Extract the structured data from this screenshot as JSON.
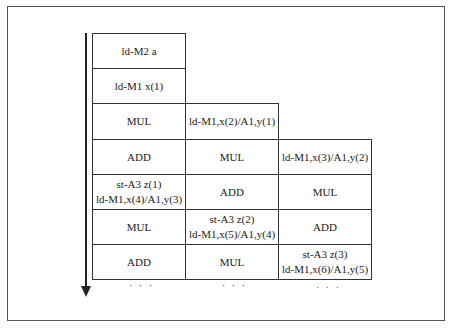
{
  "diagram": {
    "type": "pipeline-schedule",
    "time_arrow": "down",
    "columns": 3,
    "rows": [
      [
        "ld-M2 a",
        null,
        null
      ],
      [
        "ld-M1 x(1)",
        null,
        null
      ],
      [
        "MUL",
        "ld-M1,x(2)/A1,y(1)",
        null
      ],
      [
        "ADD",
        "MUL",
        "ld-M1,x(3)/A1,y(2)"
      ],
      [
        [
          "st-A3 z(1)",
          "ld-M1,x(4)/A1,y(3)"
        ],
        "ADD",
        "MUL"
      ],
      [
        "MUL",
        [
          "st-A3 z(2)",
          "ld-M1,x(5)/A1,y(4)"
        ],
        "ADD"
      ],
      [
        "ADD",
        "MUL",
        [
          "st-A3 z(3)",
          "ld-M1,x(6)/A1,y(5)"
        ]
      ]
    ],
    "continuation": [
      "· · ·",
      "· · ·",
      "· · ·"
    ]
  },
  "cells": {
    "r0c0": "ld-M2 a",
    "r1c0": "ld-M1 x(1)",
    "r2c0": "MUL",
    "r2c1": "ld-M1,x(2)/A1,y(1)",
    "r3c0": "ADD",
    "r3c1": "MUL",
    "r3c2": "ld-M1,x(3)/A1,y(2)",
    "r4c0a": "st-A3 z(1)",
    "r4c0b": "ld-M1,x(4)/A1,y(3)",
    "r4c1": "ADD",
    "r4c2": "MUL",
    "r5c0": "MUL",
    "r5c1a": "st-A3 z(2)",
    "r5c1b": "ld-M1,x(5)/A1,y(4)",
    "r5c2": "ADD",
    "r6c0": "ADD",
    "r6c1": "MUL",
    "r6c2a": "st-A3 z(3)",
    "r6c2b": "ld-M1,x(6)/A1,y(5)",
    "dots": "· · ·"
  }
}
